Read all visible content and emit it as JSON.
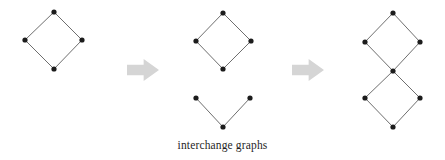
{
  "figure": {
    "caption": "interchange graphs",
    "background_color": "#ffffff",
    "vertex_color": "#1c1c1c",
    "edge_color": "#5d5d5d",
    "arrow_color": "#d5d5d5",
    "vertex_radius": 2.6,
    "edge_width": 0.9
  },
  "chart_data": {
    "type": "diagram",
    "title": "interchange graphs",
    "xlabel": "",
    "ylabel": "",
    "layout": "left-to-right transformation sequence",
    "panels": [
      {
        "id": "panel-1",
        "label": "4-cycle",
        "components": 1,
        "nodes": [
          {
            "id": "a-top",
            "x": 54,
            "y": 12
          },
          {
            "id": "a-left",
            "x": 25,
            "y": 40
          },
          {
            "id": "a-right",
            "x": 82,
            "y": 40
          },
          {
            "id": "a-bottom",
            "x": 54,
            "y": 69
          }
        ],
        "edges": [
          [
            "a-top",
            "a-left"
          ],
          [
            "a-top",
            "a-right"
          ],
          [
            "a-left",
            "a-bottom"
          ],
          [
            "a-right",
            "a-bottom"
          ]
        ]
      },
      {
        "id": "panel-2",
        "label": "4-cycle plus path",
        "components": 2,
        "nodes": [
          {
            "id": "b-top",
            "x": 223,
            "y": 13
          },
          {
            "id": "b-left",
            "x": 196,
            "y": 41
          },
          {
            "id": "b-right",
            "x": 251,
            "y": 41
          },
          {
            "id": "b-bottom",
            "x": 223,
            "y": 69
          },
          {
            "id": "c-left",
            "x": 196,
            "y": 98
          },
          {
            "id": "c-right",
            "x": 250,
            "y": 98
          },
          {
            "id": "c-apex",
            "x": 223,
            "y": 127
          }
        ],
        "edges": [
          [
            "b-top",
            "b-left"
          ],
          [
            "b-top",
            "b-right"
          ],
          [
            "b-left",
            "b-bottom"
          ],
          [
            "b-right",
            "b-bottom"
          ],
          [
            "c-left",
            "c-apex"
          ],
          [
            "c-right",
            "c-apex"
          ]
        ]
      },
      {
        "id": "panel-3",
        "label": "two 4-cycles sharing a vertex",
        "components": 1,
        "nodes": [
          {
            "id": "d-top",
            "x": 393,
            "y": 13
          },
          {
            "id": "d-upper-left",
            "x": 365,
            "y": 42
          },
          {
            "id": "d-upper-right",
            "x": 420,
            "y": 42
          },
          {
            "id": "d-center",
            "x": 393,
            "y": 71
          },
          {
            "id": "d-lower-left",
            "x": 365,
            "y": 98
          },
          {
            "id": "d-lower-right",
            "x": 420,
            "y": 98
          },
          {
            "id": "d-bottom",
            "x": 393,
            "y": 127
          }
        ],
        "edges": [
          [
            "d-top",
            "d-upper-left"
          ],
          [
            "d-top",
            "d-upper-right"
          ],
          [
            "d-upper-left",
            "d-center"
          ],
          [
            "d-upper-right",
            "d-center"
          ],
          [
            "d-center",
            "d-lower-left"
          ],
          [
            "d-center",
            "d-lower-right"
          ],
          [
            "d-lower-left",
            "d-bottom"
          ],
          [
            "d-lower-right",
            "d-bottom"
          ]
        ]
      }
    ],
    "arrows": [
      {
        "id": "arrow-1",
        "x": 127,
        "y": 59,
        "width": 32,
        "height": 22
      },
      {
        "id": "arrow-2",
        "x": 292,
        "y": 59,
        "width": 32,
        "height": 22
      }
    ]
  }
}
